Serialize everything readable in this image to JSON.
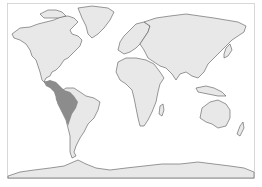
{
  "map": {
    "title": "",
    "projection": "world",
    "colors": {
      "background": "#ffffff",
      "land": "#e8e8e8",
      "coastline": "#555555",
      "highlight": "#8c8c8c",
      "frame": "#cfcfcf"
    },
    "regions": [
      {
        "name": "North America",
        "highlighted": false
      },
      {
        "name": "Greenland",
        "highlighted": false
      },
      {
        "name": "South America",
        "highlighted": false
      },
      {
        "name": "Europe",
        "highlighted": false
      },
      {
        "name": "Africa",
        "highlighted": false
      },
      {
        "name": "Asia",
        "highlighted": false
      },
      {
        "name": "Australia",
        "highlighted": false
      },
      {
        "name": "Antarctica",
        "highlighted": false
      },
      {
        "name": "Western South America & Central America range",
        "highlighted": true
      }
    ]
  }
}
